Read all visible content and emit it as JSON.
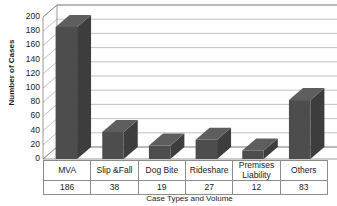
{
  "chart_data": {
    "type": "bar",
    "title": "",
    "xlabel": "Case Types and Volume",
    "ylabel": "Number of Cases",
    "categories": [
      "MVA",
      "Slip &Fall",
      "Dog Bite",
      "Rideshare",
      "Premises Liability",
      "Others"
    ],
    "values": [
      186,
      38,
      19,
      27,
      12,
      83
    ],
    "value_labels": [
      "186",
      "38",
      "19",
      "27",
      "12",
      "83"
    ],
    "ylim": [
      0,
      200
    ],
    "yticks": [
      200,
      180,
      160,
      140,
      120,
      100,
      80,
      60,
      40,
      20,
      0
    ],
    "ytick_labels": [
      "200",
      "180",
      "160",
      "140",
      "120",
      "100",
      "80",
      "60",
      "40",
      "20",
      "0"
    ],
    "grid": true,
    "legend": false,
    "legend_position": "none",
    "style": "3d-column",
    "series": [
      {
        "name": "Number of Cases",
        "values": [
          186,
          38,
          19,
          27,
          12,
          83
        ]
      }
    ],
    "colors": {
      "bar_front": "#4d4d4d",
      "bar_top": "#5e5e5e",
      "bar_side": "#3d3d3d",
      "gridline": "#a6a6a6",
      "axis": "#808080",
      "wall": "#ffffff",
      "floor": "#ffffff",
      "text": "#1a1a1a",
      "table_border": "#8c8c8c",
      "background": "#ffffff"
    }
  }
}
